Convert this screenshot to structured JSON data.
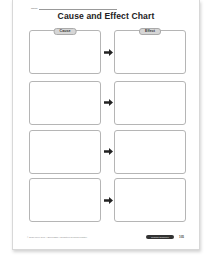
{
  "header": {
    "name_label": "Name",
    "title": "Cause and Effect Chart"
  },
  "columns": {
    "cause_label": "Cause",
    "effect_label": "Effect"
  },
  "rows": [
    {
      "cause": "",
      "effect": ""
    },
    {
      "cause": "",
      "effect": ""
    },
    {
      "cause": "",
      "effect": ""
    },
    {
      "cause": "",
      "effect": ""
    }
  ],
  "footer": {
    "copyright": "© Evan-Moor Corp. • EMC 3257 • Nonfiction Reading Practice",
    "badge": "Graphic Organizer",
    "page_number": "105"
  },
  "icons": {
    "row_connector": "right-arrow-icon"
  },
  "colors": {
    "box_border": "#b5b5b5",
    "tab_fill": "#d6d6d6",
    "arrow": "#222222",
    "badge_fill": "#333333"
  }
}
